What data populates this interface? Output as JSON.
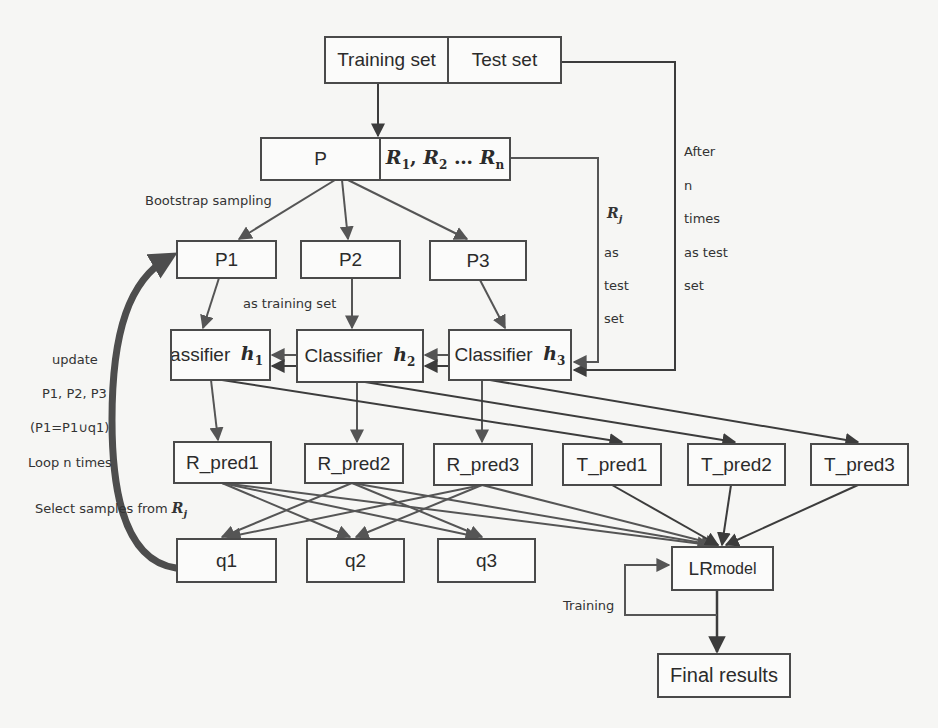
{
  "diagram": {
    "nodes": {
      "training_set": "Training set",
      "test_set": "Test set",
      "p": "P",
      "r_set": {
        "r1": "R",
        "r1_sub": "1",
        "sep1": ",  ",
        "r2": "R",
        "r2_sub": "2",
        "sep2": " … ",
        "rn": "R",
        "rn_sub": "n"
      },
      "p1": "P1",
      "p2": "P2",
      "p3": "P3",
      "classifier_prefix": "Classifier",
      "h1": {
        "var": "h",
        "sub": "1"
      },
      "h2": {
        "var": "h",
        "sub": "2"
      },
      "h3": {
        "var": "h",
        "sub": "3"
      },
      "r_pred1": "R_pred1",
      "r_pred2": "R_pred2",
      "r_pred3": "R_pred3",
      "t_pred1": "T_pred1",
      "t_pred2": "T_pred2",
      "t_pred3": "T_pred3",
      "q1": "q1",
      "q2": "q2",
      "q3": "q3",
      "lr_model_main": "LR",
      "lr_model_rest": " model",
      "final_results": "Final results"
    },
    "labels": {
      "bootstrap_sampling": "Bootstrap sampling",
      "as_training_set": "as training set",
      "rj_var": "R",
      "rj_sub": "j",
      "rj_as": "as",
      "rj_test": "test",
      "rj_set": "set",
      "after_n_times": [
        "After",
        "n",
        "times",
        "as test",
        "set"
      ],
      "loop": [
        "update",
        "P1, P2, P3",
        "(P1=P1∪q1)",
        "Loop n times"
      ],
      "select_samples": "Select samples from ",
      "select_var": "R",
      "select_sub": "j",
      "training": "Training"
    },
    "colors": {
      "stroke": "#3c3c3c",
      "stroke_light": "#5a5a5a",
      "loop_arrow": "#4d4d4d",
      "background": "#f6f6f4"
    }
  }
}
